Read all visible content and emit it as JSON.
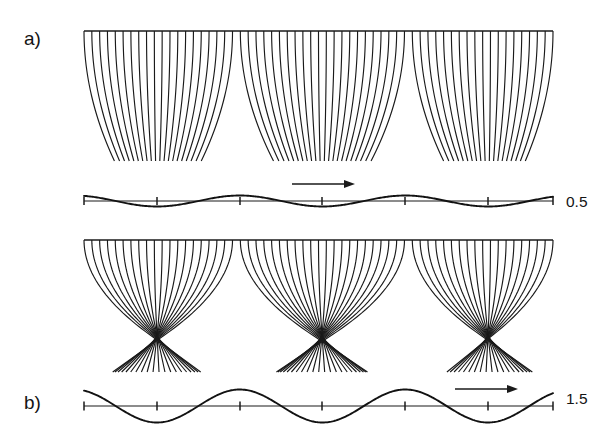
{
  "figure": {
    "type": "ray-caustic-diagram",
    "background_color": "#ffffff",
    "ink_color": "#1a1a1a",
    "width": 608,
    "height": 438,
    "panels": [
      {
        "id": "a",
        "label": "a)",
        "label_x": 24,
        "label_y": 45,
        "amplitude_label": "0.5",
        "amplitude_value": 0.5,
        "amplitude_label_x": 566,
        "amplitude_label_y": 207,
        "rays": {
          "x_left": 84,
          "x_right": 553,
          "y_top": 31,
          "y_bottom": 161,
          "count": 61,
          "focus_depth_fraction": 1.0,
          "convergence_strength": 0.5
        },
        "wave": {
          "axis_y": 201,
          "x_left": 84,
          "x_right": 553,
          "amplitude_px": 5.5,
          "wavelength_px": 165.5,
          "phase_x0": 157,
          "tick_positions": [
            84,
            157,
            240,
            322,
            405,
            488,
            553
          ],
          "tick_half_height": 4
        },
        "arrow": {
          "x_start": 292,
          "x_end": 355,
          "y": 184,
          "direction": "right",
          "head_length": 11,
          "head_half_width": 4
        }
      },
      {
        "id": "b",
        "label": "b)",
        "label_x": 24,
        "label_y": 409,
        "amplitude_label": "1.5",
        "amplitude_value": 1.5,
        "amplitude_label_x": 566,
        "amplitude_label_y": 404,
        "rays": {
          "x_left": 84,
          "x_right": 553,
          "y_top": 240,
          "y_bottom": 372,
          "count": 61,
          "focus_depth_fraction": 0.72,
          "convergence_strength": 1.5
        },
        "wave": {
          "axis_y": 406,
          "x_left": 84,
          "x_right": 553,
          "amplitude_px": 16.5,
          "wavelength_px": 165.5,
          "phase_x0": 157,
          "tick_positions": [
            84,
            157,
            240,
            322,
            405,
            488,
            553
          ],
          "tick_half_height": 4.5
        },
        "arrow": {
          "x_start": 455,
          "x_end": 518,
          "y": 389,
          "direction": "right",
          "head_length": 11,
          "head_half_width": 4
        }
      }
    ],
    "focus_x_positions": [
      157,
      322,
      488
    ]
  },
  "chart_data": {
    "type": "line",
    "title": "",
    "xlabel": "",
    "ylabel": "",
    "annotations": [
      "a)",
      "b)",
      "0.5",
      "1.5"
    ],
    "series": [
      {
        "name": "surface wave a (amplitude 0.5)",
        "wavelength": 165.5,
        "amplitude": 0.5,
        "x": [
          84,
          115,
          157,
          198,
          240,
          281,
          322,
          364,
          405,
          447,
          488,
          530,
          553
        ],
        "values": [
          0.29,
          -0.29,
          -0.5,
          -0.29,
          0.29,
          0.5,
          -0.5,
          -0.29,
          0.29,
          0.5,
          -0.5,
          0.29,
          0.45
        ]
      },
      {
        "name": "surface wave b (amplitude 1.5)",
        "wavelength": 165.5,
        "amplitude": 1.5,
        "x": [
          84,
          115,
          157,
          198,
          240,
          281,
          322,
          364,
          405,
          447,
          488,
          530,
          553
        ],
        "values": [
          0.87,
          -0.87,
          -1.5,
          -0.87,
          0.87,
          1.5,
          -1.5,
          -0.87,
          0.87,
          1.5,
          -1.5,
          0.87,
          1.35
        ]
      }
    ],
    "focus_x_positions": [
      157,
      322,
      488
    ],
    "legend": [],
    "grid": false
  }
}
